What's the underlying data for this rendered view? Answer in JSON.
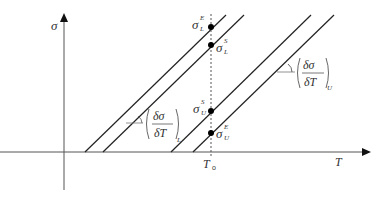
{
  "diagram": {
    "axes": {
      "y_label": "σ",
      "x_label": "T",
      "tick_label": "T",
      "tick_sub": "o"
    },
    "points": {
      "sigma_L_E": {
        "base": "σ",
        "sub": "L",
        "sup": "E"
      },
      "sigma_L_S": {
        "base": "σ",
        "sub": "L",
        "sup": "S"
      },
      "sigma_U_S": {
        "base": "σ",
        "sub": "U",
        "sup": "S"
      },
      "sigma_U_E": {
        "base": "σ",
        "sub": "U",
        "sup": "E"
      }
    },
    "slopes": {
      "lower": {
        "num": "δσ",
        "den": "δT",
        "sub": "L"
      },
      "upper": {
        "num": "δσ",
        "den": "δT",
        "sub": "U"
      }
    },
    "colors": {
      "line": "#222222",
      "axis": "#555555",
      "dash": "#555555"
    }
  }
}
